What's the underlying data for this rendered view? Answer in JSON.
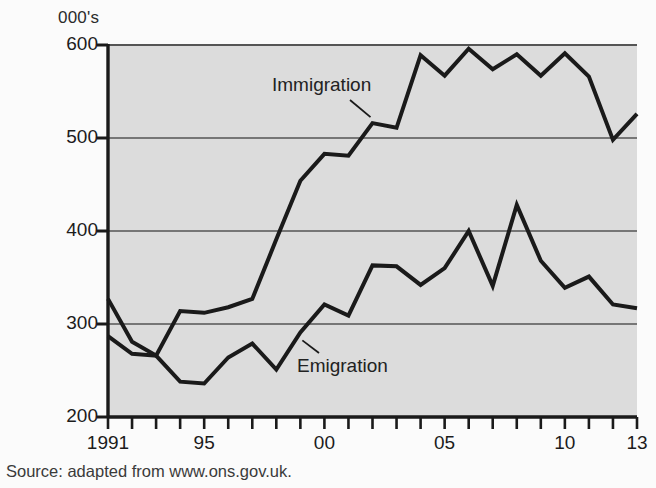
{
  "figure": {
    "unit_label": "000's",
    "source_note": "Source: adapted from www.ons.gov.uk.",
    "plot_bg_color": "#dcdcdc",
    "line_color": "#1a1a1a",
    "grid_color": "#555555",
    "axis_color": "#1a1a1a",
    "page_bg_color": "#fbfbfb"
  },
  "labels": {
    "immigration": "Immigration",
    "emigration": "Emigration"
  },
  "chart_data": {
    "type": "line",
    "title": "",
    "subtitle": "",
    "xlabel": "",
    "ylabel": "000's",
    "xlim": [
      1991,
      2013
    ],
    "ylim": [
      200,
      600
    ],
    "grid": true,
    "grid_axis": "y",
    "legend_position": "inline-annotation",
    "y_ticks": [
      200,
      300,
      400,
      500,
      600
    ],
    "y_tick_labels": [
      "200",
      "300",
      "400",
      "500",
      "600"
    ],
    "x": [
      1991,
      1992,
      1993,
      1994,
      1995,
      1996,
      1997,
      1998,
      1999,
      2000,
      2001,
      2002,
      2003,
      2004,
      2005,
      2006,
      2007,
      2008,
      2009,
      2010,
      2011,
      2012,
      2013
    ],
    "x_ticks": [
      1991,
      1992,
      1993,
      1994,
      1995,
      1996,
      1997,
      1998,
      1999,
      2000,
      2001,
      2002,
      2003,
      2004,
      2005,
      2006,
      2007,
      2008,
      2009,
      2010,
      2011,
      2012,
      2013
    ],
    "x_tick_labels": [
      "1991",
      "",
      "",
      "",
      "95",
      "",
      "",
      "",
      "",
      "00",
      "",
      "",
      "",
      "",
      "05",
      "",
      "",
      "",
      "",
      "10",
      "",
      "",
      "13"
    ],
    "x_labeled_ticks": [
      {
        "value": 1991,
        "label": "1991"
      },
      {
        "value": 1995,
        "label": "95"
      },
      {
        "value": 2000,
        "label": "00"
      },
      {
        "value": 2005,
        "label": "05"
      },
      {
        "value": 2010,
        "label": "10"
      },
      {
        "value": 2013,
        "label": "13"
      }
    ],
    "series": [
      {
        "name": "Immigration",
        "values": [
          287,
          268,
          266,
          314,
          312,
          318,
          327,
          391,
          454,
          483,
          481,
          516,
          511,
          589,
          567,
          596,
          574,
          590,
          567,
          591,
          566,
          498,
          526
        ]
      },
      {
        "name": "Emigration",
        "values": [
          327,
          281,
          266,
          238,
          236,
          264,
          279,
          251,
          291,
          321,
          309,
          363,
          362,
          342,
          360,
          400,
          341,
          428,
          368,
          339,
          351,
          321,
          317
        ]
      }
    ],
    "annotations": [
      {
        "text": "Immigration",
        "series": "Immigration",
        "x": 2002,
        "y": 516
      },
      {
        "text": "Emigration",
        "series": "Emigration",
        "x": 1999,
        "y": 291
      }
    ]
  }
}
